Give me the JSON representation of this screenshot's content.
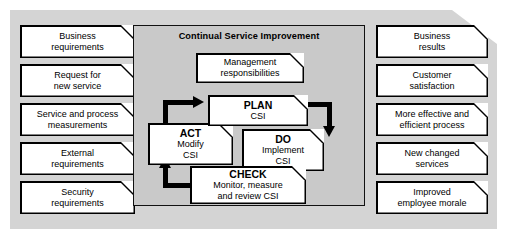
{
  "diagram": {
    "title": "Continual Service Improvement",
    "inputs": [
      {
        "lines": [
          "Business",
          "requirements"
        ]
      },
      {
        "lines": [
          "Request for",
          "new service"
        ]
      },
      {
        "lines": [
          "Service and process",
          "measurements"
        ]
      },
      {
        "lines": [
          "External",
          "requirements"
        ]
      },
      {
        "lines": [
          "Security",
          "requirements"
        ]
      }
    ],
    "outputs": [
      {
        "lines": [
          "Business",
          "results"
        ]
      },
      {
        "lines": [
          "Customer",
          "satisfaction"
        ]
      },
      {
        "lines": [
          "More effective and",
          "efficient process"
        ]
      },
      {
        "lines": [
          "New changed",
          "services"
        ]
      },
      {
        "lines": [
          "Improved",
          "employee morale"
        ]
      }
    ],
    "management": {
      "lines": [
        "Management",
        "responsibilities"
      ]
    },
    "cycle": {
      "plan": {
        "heading": "PLAN",
        "lines": [
          "CSI"
        ]
      },
      "do": {
        "heading": "DO",
        "lines": [
          "Implement",
          "CSI"
        ]
      },
      "check": {
        "heading": "CHECK",
        "lines": [
          "Monitor, measure",
          "and review CSI"
        ]
      },
      "act": {
        "heading": "ACT",
        "lines": [
          "Modify",
          "CSI"
        ]
      }
    },
    "arrows": [
      {
        "name": "act-to-plan",
        "from": "ACT",
        "to": "PLAN"
      },
      {
        "name": "plan-to-do",
        "from": "PLAN",
        "to": "DO"
      },
      {
        "name": "do-to-check",
        "from": "DO",
        "to": "CHECK"
      },
      {
        "name": "check-to-act",
        "from": "CHECK",
        "to": "ACT"
      }
    ],
    "colors": {
      "outer_panel": "#d4d4d4",
      "inner_panel": "#c9c9c9",
      "note_fill": "#ffffff",
      "stroke": "#000000",
      "page": "#ffffff"
    }
  }
}
